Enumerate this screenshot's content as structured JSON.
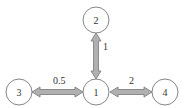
{
  "diagram": {
    "nodes": [
      {
        "id": "1",
        "label": "1",
        "cx": 96,
        "cy": 92,
        "r": 13
      },
      {
        "id": "2",
        "label": "2",
        "cx": 96,
        "cy": 20,
        "r": 13
      },
      {
        "id": "3",
        "label": "3",
        "cx": 19,
        "cy": 92,
        "r": 13
      },
      {
        "id": "4",
        "label": "4",
        "cx": 165,
        "cy": 92,
        "r": 13
      }
    ],
    "edges": [
      {
        "from": "2",
        "to": "1",
        "label": "1",
        "bidirectional": true
      },
      {
        "from": "3",
        "to": "1",
        "label": "0.5",
        "bidirectional": true
      },
      {
        "from": "1",
        "to": "4",
        "label": "2",
        "bidirectional": true
      }
    ],
    "colors": {
      "arrow_fill": "#b0b0b0",
      "arrow_stroke": "#777777",
      "node_stroke": "#777777"
    }
  }
}
